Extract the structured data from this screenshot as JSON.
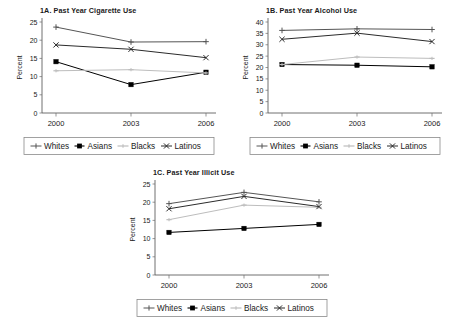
{
  "figure": {
    "series_names": [
      "Whites",
      "Asians",
      "Blacks",
      "Latinos"
    ],
    "series_colors": [
      "#555555",
      "#000000",
      "#bdbdbd",
      "#2b2b2b"
    ],
    "ylabel": "Percent",
    "categories": [
      "2000",
      "2003",
      "2006"
    ]
  },
  "chart_data": [
    {
      "id": "1A",
      "type": "line",
      "title": "1A. Past Year Cigarette Use",
      "xlabel": "",
      "ylabel": "Percent",
      "categories": [
        "2000",
        "2003",
        "2006"
      ],
      "yticks": [
        0,
        5,
        10,
        15,
        20,
        25
      ],
      "ylim": [
        0,
        25
      ],
      "grid": false,
      "legend_position": "bottom",
      "series": [
        {
          "name": "Whites",
          "marker": "plus",
          "color": "#555555",
          "values": [
            23.6,
            19.5,
            19.6
          ]
        },
        {
          "name": "Asians",
          "marker": "square",
          "color": "#000000",
          "values": [
            14.1,
            7.8,
            11.2
          ]
        },
        {
          "name": "Blacks",
          "marker": "dash",
          "color": "#bdbdbd",
          "values": [
            11.6,
            11.9,
            11.0
          ]
        },
        {
          "name": "Latinos",
          "marker": "cross",
          "color": "#2b2b2b",
          "values": [
            18.7,
            17.5,
            15.2
          ]
        }
      ]
    },
    {
      "id": "1B",
      "type": "line",
      "title": "1B. Past Year Alcohol Use",
      "xlabel": "",
      "ylabel": "Percent",
      "categories": [
        "2000",
        "2003",
        "2006"
      ],
      "yticks": [
        0,
        5,
        10,
        15,
        20,
        25,
        30,
        35,
        40
      ],
      "ylim": [
        0,
        40
      ],
      "grid": false,
      "legend_position": "bottom",
      "series": [
        {
          "name": "Whites",
          "marker": "plus",
          "color": "#555555",
          "values": [
            36.3,
            37.0,
            36.7
          ]
        },
        {
          "name": "Asians",
          "marker": "square",
          "color": "#000000",
          "values": [
            21.3,
            21.0,
            20.3
          ]
        },
        {
          "name": "Blacks",
          "marker": "dash",
          "color": "#bdbdbd",
          "values": [
            21.3,
            24.6,
            24.0
          ]
        },
        {
          "name": "Latinos",
          "marker": "cross",
          "color": "#2b2b2b",
          "values": [
            32.4,
            35.1,
            31.4
          ]
        }
      ]
    },
    {
      "id": "1C",
      "type": "line",
      "title": "1C. Past Year Illicit Use",
      "xlabel": "",
      "ylabel": "Percent",
      "categories": [
        "2000",
        "2003",
        "2006"
      ],
      "yticks": [
        0,
        5,
        10,
        15,
        20,
        25
      ],
      "ylim": [
        0,
        25
      ],
      "grid": false,
      "legend_position": "bottom",
      "series": [
        {
          "name": "Whites",
          "marker": "plus",
          "color": "#555555",
          "values": [
            19.6,
            22.7,
            20.1
          ]
        },
        {
          "name": "Asians",
          "marker": "square",
          "color": "#000000",
          "values": [
            11.7,
            12.8,
            13.9
          ]
        },
        {
          "name": "Blacks",
          "marker": "dash",
          "color": "#bdbdbd",
          "values": [
            15.2,
            19.2,
            18.6
          ]
        },
        {
          "name": "Latinos",
          "marker": "cross",
          "color": "#2b2b2b",
          "values": [
            18.2,
            21.6,
            18.8
          ]
        }
      ]
    }
  ]
}
